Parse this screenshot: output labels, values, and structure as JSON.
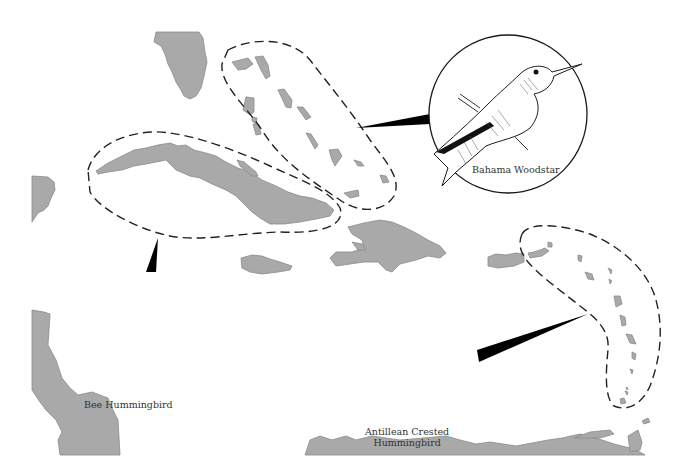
{
  "map": {
    "title": "",
    "colors": {
      "land": "#a9a9a9",
      "land_outline": "#8a8a8a",
      "background": "#ffffff",
      "range_outline": "#222222",
      "ink": "#1a1a1a"
    },
    "regions": [
      {
        "name": "Florida",
        "type": "land"
      },
      {
        "name": "Bahamas",
        "type": "island-group"
      },
      {
        "name": "Cuba",
        "type": "land"
      },
      {
        "name": "Yucatan",
        "type": "land"
      },
      {
        "name": "Jamaica",
        "type": "land"
      },
      {
        "name": "Hispaniola",
        "type": "land"
      },
      {
        "name": "Puerto Rico",
        "type": "land"
      },
      {
        "name": "Lesser Antilles",
        "type": "island-group"
      },
      {
        "name": "Central America",
        "type": "land"
      },
      {
        "name": "South America",
        "type": "land"
      },
      {
        "name": "Trinidad",
        "type": "land"
      }
    ],
    "ranges": [
      {
        "id": "bahamas-range",
        "species": "Bahama Woodstar"
      },
      {
        "id": "cuba-range",
        "species": "Bee Hummingbird"
      },
      {
        "id": "lesser-antilles-range",
        "species": "Antillean Crested Hummingbird"
      }
    ]
  },
  "medallions": [
    {
      "id": "bahama-woodstar",
      "label": "Bahama Woodstar",
      "label_lines": [
        "Bahama Woodstar"
      ]
    },
    {
      "id": "bee-hummingbird",
      "label": "Bee Hummingbird",
      "label_lines": [
        "Bee Hummingbird"
      ]
    },
    {
      "id": "antillean-crested",
      "label": "Antillean Crested Hummingbird",
      "label_lines": [
        "Antillean Crested",
        "Hummingbird"
      ]
    }
  ]
}
